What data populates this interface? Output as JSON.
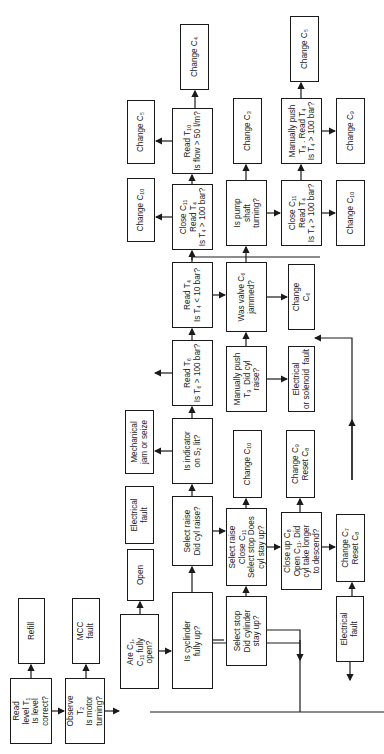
{
  "diagram": {
    "type": "flowchart",
    "orientation": "rotated-90-ccw",
    "nodes": [
      {
        "id": "n1",
        "text": "Read\nlevel T₁\nIs level\ncorrect?",
        "x": 10,
        "y": 678,
        "w": 42,
        "h": 66
      },
      {
        "id": "n2",
        "text": "Refill",
        "x": 18,
        "y": 598,
        "w": 27,
        "h": 66
      },
      {
        "id": "n3",
        "text": "Observe\nT₂\nIs motor\nturning?",
        "x": 65,
        "y": 678,
        "w": 40,
        "h": 66
      },
      {
        "id": "n4",
        "text": "MCC\nfault",
        "x": 72,
        "y": 598,
        "w": 28,
        "h": 66
      },
      {
        "id": "n5",
        "text": "Are C₁,\nC₁₁ fully\nopen?",
        "x": 120,
        "y": 614,
        "w": 39,
        "h": 75
      },
      {
        "id": "n6",
        "text": "Open",
        "x": 127,
        "y": 549,
        "w": 27,
        "h": 52
      },
      {
        "id": "n7",
        "text": "Is cyclinder\nfully up?",
        "x": 172,
        "y": 592,
        "w": 41,
        "h": 97
      },
      {
        "id": "n8",
        "text": "Select raise\nDid cyl raise?",
        "x": 172,
        "y": 496,
        "w": 41,
        "h": 70
      },
      {
        "id": "n9",
        "text": "Electrical\nfault",
        "x": 125,
        "y": 486,
        "w": 29,
        "h": 58
      },
      {
        "id": "n10",
        "text": "Is indicator\non S₂ lit?",
        "x": 172,
        "y": 418,
        "w": 41,
        "h": 66
      },
      {
        "id": "n11",
        "text": "Mechanical\njam or seize",
        "x": 125,
        "y": 410,
        "w": 29,
        "h": 64
      },
      {
        "id": "n12",
        "text": "Read T₆\nIs T₆ > 100 bar?",
        "x": 172,
        "y": 340,
        "w": 41,
        "h": 66
      },
      {
        "id": "n13",
        "text": "Read T₄\nIs T₄ < 10 bar?",
        "x": 172,
        "y": 262,
        "w": 41,
        "h": 66
      },
      {
        "id": "n14",
        "text": "Close C₁₁\nRead T₄\nIs T₄ > 100 bar?",
        "x": 172,
        "y": 184,
        "w": 41,
        "h": 66
      },
      {
        "id": "n15",
        "text": "Change C₁₀",
        "x": 127,
        "y": 178,
        "w": 28,
        "h": 64
      },
      {
        "id": "n16",
        "text": "Read T₁₀\nIs flow > 50 l/m?",
        "x": 172,
        "y": 108,
        "w": 41,
        "h": 66
      },
      {
        "id": "n17",
        "text": "Change C₅",
        "x": 127,
        "y": 100,
        "w": 28,
        "h": 64
      },
      {
        "id": "n18",
        "text": "Change C₄",
        "x": 180,
        "y": 24,
        "w": 29,
        "h": 66
      },
      {
        "id": "n19",
        "text": "Select stop\nDid cylinder\nstay up?",
        "x": 226,
        "y": 596,
        "w": 41,
        "h": 70
      },
      {
        "id": "n20",
        "text": "Select raise\nClose C₁₁\nSelect stop Does\ncyl stay up?",
        "x": 226,
        "y": 508,
        "w": 41,
        "h": 78
      },
      {
        "id": "n21",
        "text": "Change C₁₀",
        "x": 233,
        "y": 430,
        "w": 29,
        "h": 68
      },
      {
        "id": "n22",
        "text": "Manually push\nT₉  Did cyl\nraise?",
        "x": 226,
        "y": 346,
        "w": 41,
        "h": 66
      },
      {
        "id": "n23",
        "text": "Was valve C₆\njammed?",
        "x": 226,
        "y": 262,
        "w": 41,
        "h": 70
      },
      {
        "id": "n24",
        "text": "Is pump\nshaft\nturning?",
        "x": 226,
        "y": 180,
        "w": 41,
        "h": 66
      },
      {
        "id": "n25",
        "text": "Change C₃",
        "x": 233,
        "y": 98,
        "w": 29,
        "h": 66
      },
      {
        "id": "n26",
        "text": "Close up C₈\nOpen C₁₁. Did\ncyl take longer\nto descend?",
        "x": 281,
        "y": 512,
        "w": 41,
        "h": 78
      },
      {
        "id": "n27",
        "text": "Change C₉\nReset C₈",
        "x": 286,
        "y": 430,
        "w": 29,
        "h": 68
      },
      {
        "id": "n28",
        "text": "Electrical\nor solenoid  fault",
        "x": 288,
        "y": 346,
        "w": 27,
        "h": 66
      },
      {
        "id": "n29",
        "text": "Change\nC₆",
        "x": 288,
        "y": 264,
        "w": 27,
        "h": 66
      },
      {
        "id": "n30",
        "text": "Close C₁₁\nRead T₄\nIs T₄ > 100 bar?",
        "x": 281,
        "y": 180,
        "w": 41,
        "h": 66
      },
      {
        "id": "n31",
        "text": "Manually push\nT₈ . Read T₄\nIs T₄ > 100 bar?",
        "x": 281,
        "y": 98,
        "w": 41,
        "h": 66
      },
      {
        "id": "n32",
        "text": "Change C₅",
        "x": 290,
        "y": 16,
        "w": 29,
        "h": 66
      },
      {
        "id": "n33",
        "text": "Change C₇\nReset C₈",
        "x": 336,
        "y": 514,
        "w": 29,
        "h": 68
      },
      {
        "id": "n34",
        "text": "Electrical\nfault",
        "x": 336,
        "y": 596,
        "w": 28,
        "h": 66
      },
      {
        "id": "n35",
        "text": "Change C₁₀",
        "x": 336,
        "y": 180,
        "w": 29,
        "h": 66
      },
      {
        "id": "n36",
        "text": "Change C₉",
        "x": 336,
        "y": 98,
        "w": 29,
        "h": 66
      }
    ],
    "edge_labels": {
      "yes": "Y",
      "no": "N"
    }
  }
}
